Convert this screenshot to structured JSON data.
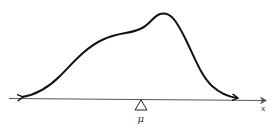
{
  "diagram": {
    "axis_label": "x",
    "fulcrum_label": "μ",
    "colors": {
      "curve": "#111111",
      "axis": "#555555",
      "fulcrum": "#222222"
    }
  }
}
